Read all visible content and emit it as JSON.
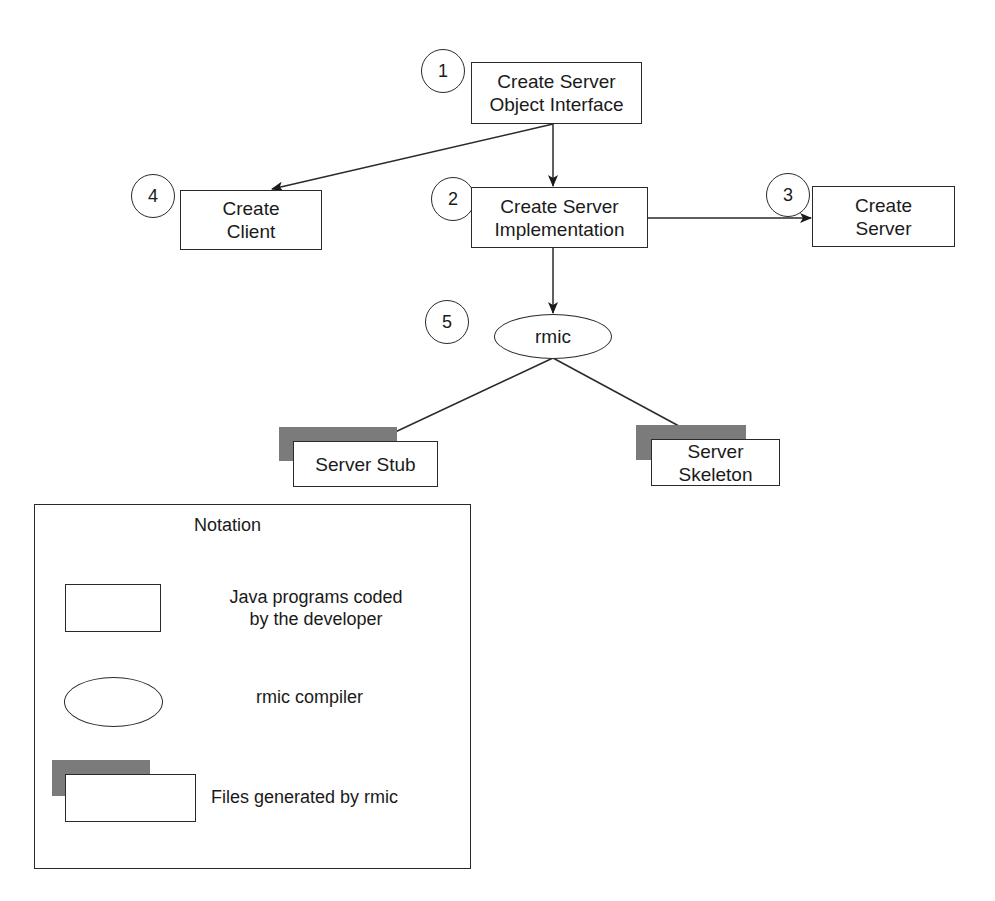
{
  "diagram": {
    "type": "flowchart",
    "nodes": [
      {
        "id": "n1",
        "step": "1",
        "line1": "Create Server",
        "line2": "Object Interface",
        "shape": "box"
      },
      {
        "id": "n2",
        "step": "2",
        "line1": "Create Server",
        "line2": "Implementation",
        "shape": "box"
      },
      {
        "id": "n3",
        "step": "3",
        "line1": "Create",
        "line2": "Server",
        "shape": "box"
      },
      {
        "id": "n4",
        "step": "4",
        "line1": "Create",
        "line2": "Client",
        "shape": "box"
      },
      {
        "id": "n5",
        "step": "5",
        "label": "rmic",
        "shape": "ellipse"
      },
      {
        "id": "stub",
        "label": "Server Stub",
        "shape": "generated-file"
      },
      {
        "id": "skeleton",
        "label": "Server Skeleton",
        "shape": "generated-file"
      }
    ],
    "edges": [
      {
        "from": "n1",
        "to": "n2"
      },
      {
        "from": "n1",
        "to": "n4"
      },
      {
        "from": "n2",
        "to": "n3"
      },
      {
        "from": "n2",
        "to": "n5"
      },
      {
        "from": "n5",
        "to": "stub"
      },
      {
        "from": "n5",
        "to": "skeleton"
      }
    ]
  },
  "notation": {
    "title": "Notation",
    "items": [
      {
        "shape": "box",
        "line1": "Java programs coded",
        "line2": "by the developer"
      },
      {
        "shape": "ellipse",
        "label": "rmic compiler"
      },
      {
        "shape": "generated-file",
        "label": "Files generated by rmic"
      }
    ]
  },
  "colors": {
    "line": "#2a2a2a",
    "shadow": "#7b7b7b",
    "background": "#ffffff"
  }
}
